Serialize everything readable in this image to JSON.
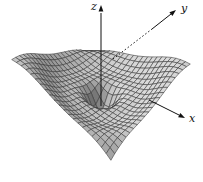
{
  "figure": {
    "background": "#ffffff"
  },
  "chart_data": {
    "type": "surface",
    "title": "",
    "axes": {
      "x_label": "x",
      "y_label": "y",
      "z_label": "z",
      "tick_labels_shown": false,
      "x_axis_direction": "lower-right arrow",
      "y_axis_direction": "upper-right arrow, dotted where hidden in front of surface",
      "z_axis_direction": "vertical arrow through surface center"
    },
    "domain": {
      "x": [
        -3.2,
        3.2
      ],
      "y": [
        -3.2,
        3.2
      ]
    },
    "grid": {
      "divisions": 21,
      "on": true
    },
    "surface_function": {
      "form": "z = a*x*y + b*x + c*cos(freq*r + phase) + d*tanh(r-1) + e*exp(-(r/w)^2) + k, r = sqrt(x^2+y^2)",
      "a": 0.1,
      "b": -0.05,
      "c": 0.24,
      "freq": 1.8,
      "phase": -0.4,
      "d": 0.3,
      "e": -1.35,
      "w": 0.75,
      "k": 0.25,
      "z_min": -1.15,
      "features": "deep pit at origin (z ~ -1.1), rippled ring valley near r=2, rim rising to z ~ 0.8-1.7 with saddle tilt (back-right and front-left high, front-right corner low)"
    },
    "view": {
      "origin_px": [
        101,
        97
      ],
      "x_axis_px_per_unit": [
        15.5,
        7.6
      ],
      "y_axis_px_per_unit": [
        12.4,
        -8.0
      ],
      "z_px_per_unit": 22,
      "light": [
        -0.45,
        -0.25,
        0.86
      ]
    },
    "style": {
      "fill_base": 100,
      "fill_range": 120,
      "fill_max": 235,
      "stroke": "#333333",
      "stroke_width": 0.55,
      "axis_color": "#111111",
      "axis_width": 1,
      "hidden_dash": "1.5 2.2"
    },
    "axes_overlay": {
      "z": {
        "line": [
          [
            101,
            13
          ],
          [
            101,
            106
          ]
        ],
        "tip": [
          101,
          5
        ],
        "label_pos": [
          91,
          10
        ]
      },
      "y": {
        "dashed": [
          [
            113,
            59
          ],
          [
            152,
            29
          ]
        ],
        "solid": [
          [
            152,
            29
          ],
          [
            171,
            14
          ]
        ],
        "tip": [
          176,
          10
        ],
        "label_pos": [
          181,
          12
        ]
      },
      "x": {
        "solid": [
          [
            149,
            100
          ],
          [
            179,
            115
          ]
        ],
        "tip": [
          185,
          118
        ],
        "label_pos": [
          189,
          122
        ]
      }
    }
  },
  "labels": {
    "x": "x",
    "y": "y",
    "z": "z"
  }
}
